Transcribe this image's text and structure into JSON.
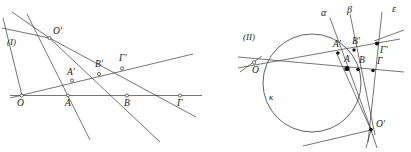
{
  "figure": {
    "stroke_color": "#3a3a3a",
    "label_color": "#1a1a1a",
    "background": "#ffffff",
    "panels": [
      {
        "id": "panel-1",
        "caption": "(I)",
        "type": "projective-perspectivity-two-lines",
        "labels": {
          "center": "O'",
          "base_points": [
            "O",
            "A",
            "B",
            "Γ"
          ],
          "image_points": [
            "A'",
            "B'",
            "Γ'"
          ]
        }
      },
      {
        "id": "panel-2",
        "caption": "(II)",
        "type": "projective-perspectivity-on-conic",
        "labels": {
          "circle": "κ",
          "center_left": "O",
          "center_right": "O'",
          "base_points": [
            "A",
            "B",
            "Γ"
          ],
          "image_points": [
            "A'",
            "B'",
            "Γ'"
          ],
          "line_names": [
            "α",
            "β",
            "ε"
          ]
        }
      }
    ]
  },
  "panel1": {
    "caption": "(I)",
    "O_prime": "O'",
    "O": "O",
    "A": "A",
    "B": "B",
    "Gamma": "Γ",
    "A_prime": "A'",
    "B_prime": "B'",
    "Gamma_prime": "Γ'"
  },
  "panel2": {
    "caption": "(II)",
    "kappa": "κ",
    "alpha": "α",
    "beta": "β",
    "epsilon": "ε",
    "O": "O",
    "O_prime": "O'",
    "A": "A",
    "B": "B",
    "Gamma": "Γ",
    "A_prime": "A'",
    "B_prime": "B'",
    "Gamma_prime": "Γ'"
  }
}
